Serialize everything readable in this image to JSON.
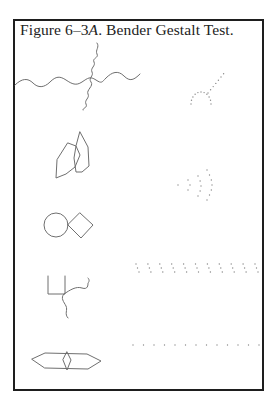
{
  "figure": {
    "caption_prefix": "Figure 6–3",
    "caption_italic": "A",
    "caption_suffix": ".  Bender  Gestalt  Test.",
    "colors": {
      "frame": "#1e1e1e",
      "line": "#6f6f6f",
      "dots": "#8a8a8a",
      "background": "#ffffff"
    },
    "designs": [
      {
        "id": "wavy-cross",
        "label": "intersecting sinusoidal curves"
      },
      {
        "id": "dotted-arc",
        "label": "dotted arc with diagonal"
      },
      {
        "id": "overlapping-hexagons",
        "label": "overlapping hexagons"
      },
      {
        "id": "dotted-arcs",
        "label": "dotted concentric arcs"
      },
      {
        "id": "circle-diamond",
        "label": "circle and diamond"
      },
      {
        "id": "dot-columns",
        "label": "row of slanted dot columns"
      },
      {
        "id": "square-curve",
        "label": "open square with curve"
      },
      {
        "id": "dot-row",
        "label": "row of dots"
      },
      {
        "id": "hexagon-diamond",
        "label": "elongated hexagon with diamond"
      }
    ]
  }
}
